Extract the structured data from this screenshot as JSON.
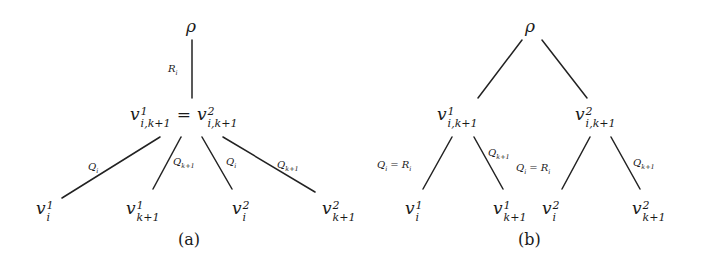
{
  "figure": {
    "panels": [
      {
        "id": "a",
        "caption": "(a)",
        "root": "ρ",
        "root_edge_label": "R_i",
        "middle_node": {
          "left": {
            "base": "v",
            "sup": "1",
            "sub": "i,k+1"
          },
          "eq": "=",
          "right": {
            "base": "v",
            "sup": "2",
            "sub": "i,k+1"
          }
        },
        "edges": [
          {
            "label_base": "Q",
            "label_sub": "i"
          },
          {
            "label_base": "Q",
            "label_sub": "k+1"
          },
          {
            "label_base": "Q",
            "label_sub": "i"
          },
          {
            "label_base": "Q",
            "label_sub": "k+1"
          }
        ],
        "leaves": [
          {
            "base": "v",
            "sup": "1",
            "sub": "i"
          },
          {
            "base": "v",
            "sup": "1",
            "sub": "k+1"
          },
          {
            "base": "v",
            "sup": "2",
            "sub": "i"
          },
          {
            "base": "v",
            "sup": "2",
            "sub": "k+1"
          }
        ]
      },
      {
        "id": "b",
        "caption": "(b)",
        "root": "ρ",
        "internal_nodes": [
          {
            "base": "v",
            "sup": "1",
            "sub": "i,k+1"
          },
          {
            "base": "v",
            "sup": "2",
            "sub": "i,k+1"
          }
        ],
        "edges": [
          {
            "label": "Q_i = R_i",
            "label_left": "Q",
            "label_left_sub": "i",
            "eq": "=",
            "label_right": "R",
            "label_right_sub": "i"
          },
          {
            "label_base": "Q",
            "label_sub": "k+1"
          },
          {
            "label": "Q_i = R_i",
            "label_left": "Q",
            "label_left_sub": "i",
            "eq": "=",
            "label_right": "R",
            "label_right_sub": "i"
          },
          {
            "label_base": "Q",
            "label_sub": "k+1"
          }
        ],
        "leaves": [
          {
            "base": "v",
            "sup": "1",
            "sub": "i"
          },
          {
            "base": "v",
            "sup": "1",
            "sub": "k+1"
          },
          {
            "base": "v",
            "sup": "2",
            "sub": "i"
          },
          {
            "base": "v",
            "sup": "2",
            "sub": "k+1"
          }
        ]
      }
    ]
  }
}
